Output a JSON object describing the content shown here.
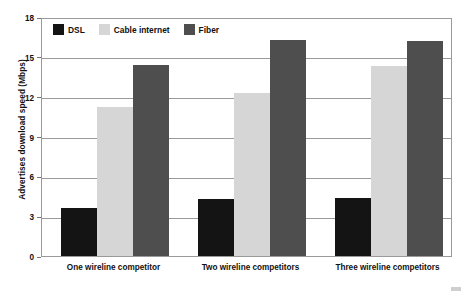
{
  "chart_data": {
    "type": "bar",
    "title": "",
    "subtitle": "",
    "xlabel": "",
    "ylabel": "Advertises download speed (Mbps)",
    "categories": [
      "One wireline competitor",
      "Two wireline competitors",
      "Three wireline competitors"
    ],
    "series": [
      {
        "name": "DSL",
        "color": "#141414",
        "values": [
          3.6,
          4.3,
          4.4
        ]
      },
      {
        "name": "Cable internet",
        "color": "#d6d6d6",
        "values": [
          11.2,
          12.3,
          14.3
        ]
      },
      {
        "name": "Fiber",
        "color": "#4e4e4e",
        "values": [
          14.4,
          16.3,
          16.2
        ]
      }
    ],
    "ylim": [
      0,
      18
    ],
    "yticks": [
      0,
      3,
      6,
      9,
      12,
      15,
      18
    ],
    "ytick_labels": [
      "0",
      "3",
      "6",
      "9",
      "12",
      "15",
      "18"
    ],
    "grid": true,
    "legend_position": "top-left",
    "legend_entries": [
      "DSL",
      "Cable internet",
      "Fiber"
    ],
    "annotations": []
  }
}
